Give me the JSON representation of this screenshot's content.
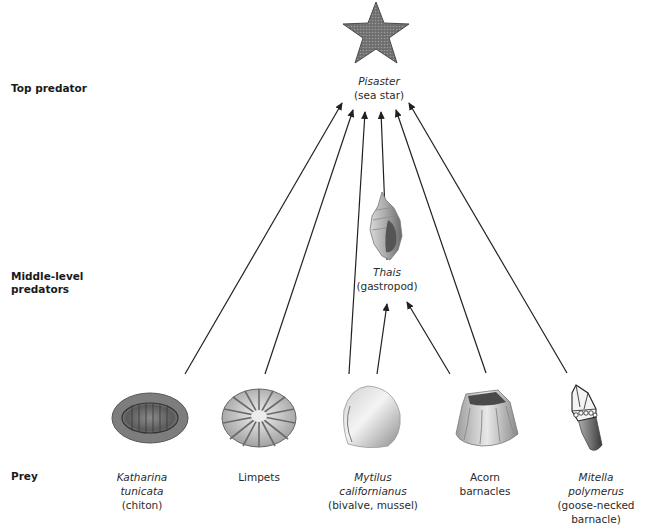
{
  "levels": {
    "top": "Top predator",
    "middle_line1": "Middle-level",
    "middle_line2": "predators",
    "prey": "Prey"
  },
  "organisms": {
    "pisaster": {
      "sci": "Pisaster",
      "common": "(sea star)",
      "icon": "sea-star-icon"
    },
    "thais": {
      "sci": "Thais",
      "common": "(gastropod)",
      "icon": "snail-shell-icon"
    },
    "chiton": {
      "sci_line1": "Katharina",
      "sci_line2": "tunicata",
      "common": "(chiton)",
      "icon": "chiton-icon"
    },
    "limpets": {
      "common": "Limpets",
      "icon": "limpet-icon"
    },
    "mytilus": {
      "sci_line1": "Mytilus",
      "sci_line2": "californianus",
      "common": "(bivalve, mussel)",
      "icon": "mussel-icon"
    },
    "acorn": {
      "common_line1": "Acorn",
      "common_line2": "barnacles",
      "icon": "acorn-barnacle-icon"
    },
    "mitella": {
      "sci_line1": "Mitella",
      "sci_line2": "polymerus",
      "common_line1": "(goose-necked",
      "common_line2": "barnacle)",
      "icon": "goose-barnacle-icon"
    }
  },
  "edges": [
    {
      "from": "Katharina tunicata",
      "to": "Pisaster"
    },
    {
      "from": "Limpets",
      "to": "Pisaster"
    },
    {
      "from": "Mytilus californianus",
      "to": "Pisaster"
    },
    {
      "from": "Thais",
      "to": "Pisaster"
    },
    {
      "from": "Acorn barnacles",
      "to": "Pisaster"
    },
    {
      "from": "Mitella polymerus",
      "to": "Pisaster"
    },
    {
      "from": "Mytilus californianus",
      "to": "Thais"
    },
    {
      "from": "Acorn barnacles",
      "to": "Thais"
    }
  ],
  "colors": {
    "arrow": "#231f20",
    "text": "#231f20",
    "background": "#ffffff"
  }
}
